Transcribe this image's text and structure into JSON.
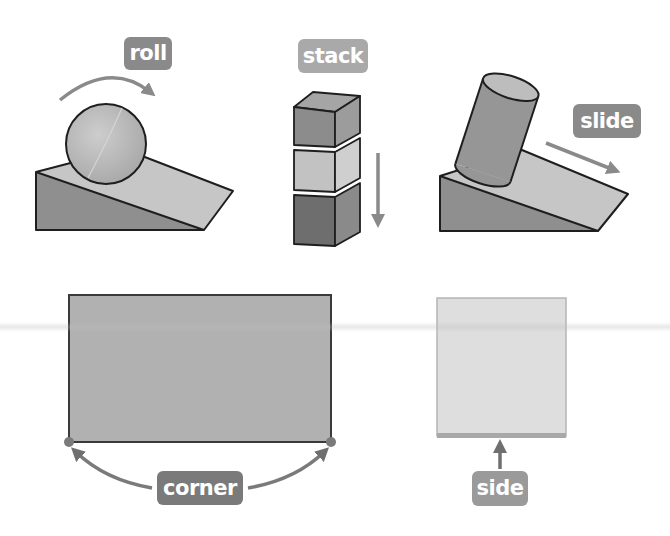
{
  "labels": {
    "roll": "roll",
    "stack": "stack",
    "slide": "slide",
    "corner": "corner",
    "side": "side"
  },
  "colors": {
    "badge_dark": "#8a8a8a",
    "badge_light": "#a9a9a9",
    "ramp_top": "#c6c6c6",
    "ramp_side": "#8f8f8f",
    "sphere": "#b8b8b8",
    "cylinder": "#969696",
    "cylinder_top": "#bdbdbd",
    "cube_top_front": "#8c8c8c",
    "cube_mid_front": "#c2c2c2",
    "cube_bottom_front": "#6e6e6e",
    "rectangle_fill": "#b1b1b1",
    "square_fill": "#dedede",
    "square_side_edge": "#a8a8a8",
    "arrow": "#8a8a8a",
    "outline": "#1e1e1e"
  },
  "panels": [
    {
      "id": "roll",
      "shape": "sphere on ramp",
      "motion": "curved arrow clockwise"
    },
    {
      "id": "stack",
      "shape": "three stacked cubes",
      "motion": "downward arrow"
    },
    {
      "id": "slide",
      "shape": "cylinder on ramp",
      "motion": "diagonal arrow down-right"
    },
    {
      "id": "corner",
      "shape": "rectangle",
      "callout": "arrows to two bottom corners"
    },
    {
      "id": "side",
      "shape": "square",
      "callout": "arrow to bottom side"
    }
  ]
}
